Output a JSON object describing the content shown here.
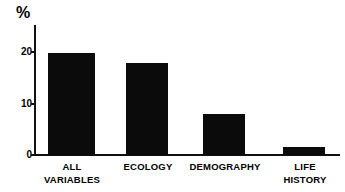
{
  "chart_data": {
    "type": "bar",
    "title": "",
    "xlabel": "",
    "ylabel": "%",
    "categories": [
      "ALL VARIABLES",
      "ECOLOGY",
      "DEMOGRAPHY",
      "LIFE HISTORY"
    ],
    "category_lines": [
      [
        "ALL",
        "VARIABLES"
      ],
      [
        "ECOLOGY",
        ""
      ],
      [
        "DEMOGRAPHY",
        ""
      ],
      [
        "LIFE",
        "HISTORY"
      ]
    ],
    "values": [
      19.8,
      18.0,
      8.0,
      1.5
    ],
    "ylim": [
      0,
      23
    ],
    "yticks": [
      0,
      10,
      20
    ],
    "ytick_labels": [
      "0",
      "10",
      "20"
    ],
    "grid": false,
    "legend": false,
    "bar_color": "#0b0b0b",
    "axis_color": "#111111",
    "background_color": "#ffffff"
  },
  "axis": {
    "unit_label": "%"
  }
}
